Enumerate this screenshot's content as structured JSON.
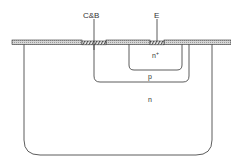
{
  "diagram": {
    "type": "semiconductor cross-section",
    "labels": {
      "collector_base_contact": "C&B",
      "emitter_contact": "E",
      "n_plus_region": "n",
      "n_plus_superscript": "+",
      "p_region": "p",
      "n_region": "n"
    },
    "colors": {
      "line": "#333333",
      "oxide_fill": "#bdbdbd",
      "hatch": "#555555",
      "background": "#ffffff"
    }
  }
}
